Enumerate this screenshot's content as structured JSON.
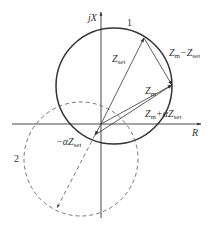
{
  "diagram": {
    "axes": {
      "y_label": "jX",
      "x_label": "R"
    },
    "circles": [
      {
        "id": "1",
        "label": "1",
        "style": "solid"
      },
      {
        "id": "2",
        "label": "2",
        "style": "dashed"
      }
    ],
    "vectors": {
      "zset": {
        "main": "Z",
        "sub": "set"
      },
      "zm": {
        "main": "Z",
        "sub": "m"
      },
      "zm_minus_zset": {
        "part1": "Z",
        "sub1": "m",
        "op": "−Z",
        "sub2": "set"
      },
      "zm_plus_azset": {
        "part1": "Z",
        "sub1": "m",
        "op": "+αZ",
        "sub2": "set"
      },
      "neg_azset": {
        "prefix": "−αZ",
        "sub": "set"
      }
    },
    "colors": {
      "line": "#333333",
      "dashed": "#555555",
      "background": "#ffffff"
    }
  }
}
